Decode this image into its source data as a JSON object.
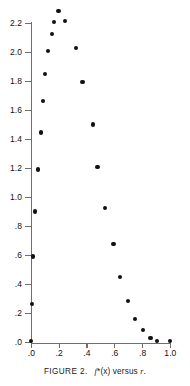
{
  "caption": {
    "label": "FIGURE 2.",
    "expression_f": "f",
    "expression_star": "*",
    "expression_arg": "(x)",
    "expression_versus": "versus",
    "expression_r": "r",
    "expression_period": ".",
    "full_text": "FIGURE 2.  f*(x) versus r."
  },
  "chart_data": {
    "type": "scatter",
    "title": "",
    "subtitle": "",
    "xlabel": "",
    "ylabel": "",
    "xlim": [
      0.0,
      1.0
    ],
    "ylim": [
      0.0,
      2.3
    ],
    "grid": false,
    "legend": false,
    "legend_position": "none",
    "marker": "filled-circle",
    "marker_color": "#111111",
    "axis_color": "#6e6e6e",
    "xticks": [
      0.0,
      0.2,
      0.4,
      0.6,
      0.8,
      1.0
    ],
    "xtick_labels": [
      ".0",
      ".2",
      ".4",
      ".6",
      ".8",
      "1.0"
    ],
    "yticks": [
      0.0,
      0.2,
      0.4,
      0.6,
      0.8,
      1.0,
      1.2,
      1.4,
      1.6,
      1.8,
      2.0,
      2.2
    ],
    "ytick_labels": [
      ".0",
      ".2",
      ".4",
      ".6",
      ".8",
      "1.0",
      "1.2",
      "1.4",
      "1.6",
      "1.8",
      "2.0",
      "2.2"
    ],
    "series": [
      {
        "name": "f*(x)",
        "points": [
          {
            "x": 0.0,
            "y": 0.01
          },
          {
            "x": 0.005,
            "y": 0.27
          },
          {
            "x": 0.01,
            "y": 0.595
          },
          {
            "x": 0.025,
            "y": 0.905
          },
          {
            "x": 0.05,
            "y": 1.195
          },
          {
            "x": 0.068,
            "y": 1.45
          },
          {
            "x": 0.085,
            "y": 1.665
          },
          {
            "x": 0.1,
            "y": 1.855
          },
          {
            "x": 0.118,
            "y": 2.01
          },
          {
            "x": 0.147,
            "y": 2.13
          },
          {
            "x": 0.165,
            "y": 2.215
          },
          {
            "x": 0.195,
            "y": 2.29
          },
          {
            "x": 0.243,
            "y": 2.22
          },
          {
            "x": 0.322,
            "y": 2.035
          },
          {
            "x": 0.367,
            "y": 1.8
          },
          {
            "x": 0.445,
            "y": 1.505
          },
          {
            "x": 0.475,
            "y": 1.215
          },
          {
            "x": 0.53,
            "y": 0.93
          },
          {
            "x": 0.59,
            "y": 0.68
          },
          {
            "x": 0.64,
            "y": 0.455
          },
          {
            "x": 0.697,
            "y": 0.29
          },
          {
            "x": 0.748,
            "y": 0.165
          },
          {
            "x": 0.8,
            "y": 0.09
          },
          {
            "x": 0.857,
            "y": 0.035
          },
          {
            "x": 0.905,
            "y": 0.01
          },
          {
            "x": 1.0,
            "y": 0.01
          }
        ]
      }
    ]
  }
}
